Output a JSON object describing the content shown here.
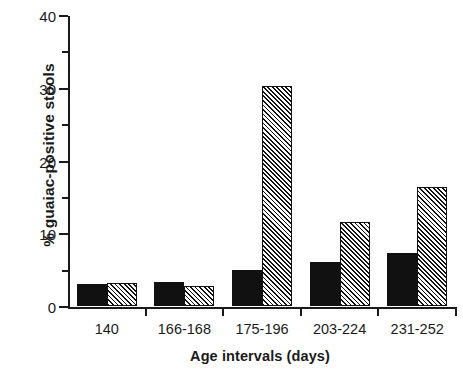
{
  "chart_data": {
    "type": "bar",
    "title": "",
    "subtitle": "",
    "xlabel": "Age intervals (days)",
    "ylabel": "% guaiac-positive stools",
    "categories": [
      "140",
      "166-168",
      "175-196",
      "203-224",
      "231-252"
    ],
    "series": [
      {
        "name": "solid-black",
        "fill": "solid",
        "color": "#111111",
        "values": [
          3.0,
          3.3,
          5.0,
          6.0,
          7.3
        ]
      },
      {
        "name": "hatched",
        "fill": "diagonal-hatch",
        "color": "#111111",
        "values": [
          3.2,
          2.7,
          30.3,
          11.5,
          16.3
        ]
      }
    ],
    "ylim": [
      0,
      40
    ],
    "ytick_labels": [
      "0",
      "10",
      "20",
      "30",
      "40"
    ],
    "ytick_values": [
      0,
      10,
      20,
      30,
      40
    ],
    "yminor_values": [
      5,
      15,
      25,
      35
    ],
    "grid": false,
    "legend": "none",
    "xtick_values": [
      0,
      1,
      2,
      3,
      4,
      5
    ]
  }
}
